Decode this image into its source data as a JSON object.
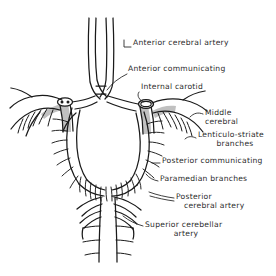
{
  "figure": {
    "style": "pen-and-ink anatomical line drawing",
    "ink_color": "#1a1a1a",
    "shade_color": "#6b6b6b",
    "background_color": "#ffffff",
    "text_color": "#2b2b2b"
  },
  "labels": [
    {
      "id": "anterior-cerebral-artery",
      "text": "Anterior cerebral artery",
      "lines": [
        "Anterior cerebral artery"
      ],
      "x": 133,
      "y": 44
    },
    {
      "id": "anterior-communicating",
      "text": "Anterior communicating",
      "lines": [
        "Anterior communicating"
      ],
      "x": 128,
      "y": 70
    },
    {
      "id": "internal-carotid",
      "text": "Internal carotid",
      "lines": [
        "Internal carotid"
      ],
      "x": 141,
      "y": 88
    },
    {
      "id": "middle-cerebral",
      "text": "Middle cerebral",
      "lines": [
        "Middle",
        "cerebral"
      ],
      "x": 205,
      "y": 114
    },
    {
      "id": "lenticulo-striate-branches",
      "text": "Lenticulo-striate branches",
      "lines": [
        "Lenticulo-striate",
        "branches"
      ],
      "x": 198,
      "y": 136
    },
    {
      "id": "posterior-communicating",
      "text": "Posterior communicating",
      "lines": [
        "Posterior communicating"
      ],
      "x": 162,
      "y": 161
    },
    {
      "id": "paramedian-branches",
      "text": "Paramedian branches",
      "lines": [
        "Paramedian branches"
      ],
      "x": 160,
      "y": 179
    },
    {
      "id": "posterior-cerebral-artery",
      "text": "Posterior cerebral artery",
      "lines": [
        "Posterior",
        "cerebral artery"
      ],
      "x": 176,
      "y": 196
    },
    {
      "id": "superior-cerebellar-artery",
      "text": "Superior cerebellar artery",
      "lines": [
        "Superior cerebellar",
        "artery"
      ],
      "x": 145,
      "y": 224
    }
  ],
  "structures": [
    {
      "id": "anterior-cerebral-arteries",
      "name": "Anterior cerebral arteries",
      "note": "paired vertical vessels ascending from top of circle"
    },
    {
      "id": "anterior-communicating-artery",
      "name": "Anterior communicating artery",
      "note": "short bridge joining the two anterior cerebrals"
    },
    {
      "id": "internal-carotid-left",
      "name": "Left internal carotid artery",
      "note": "cut stump, shaded, elliptical lumen"
    },
    {
      "id": "internal-carotid-right",
      "name": "Right internal carotid artery",
      "note": "cut stump, shaded, elliptical lumen"
    },
    {
      "id": "middle-cerebral-left",
      "name": "Left middle cerebral artery",
      "note": "curves laterally with lenticulostriate twigs"
    },
    {
      "id": "middle-cerebral-right",
      "name": "Right middle cerebral artery",
      "note": "curves laterally with lenticulostriate twigs"
    },
    {
      "id": "posterior-communicating-left",
      "name": "Left posterior communicating artery"
    },
    {
      "id": "posterior-communicating-right",
      "name": "Right posterior communicating artery"
    },
    {
      "id": "posterior-cerebral-left",
      "name": "Left posterior cerebral artery"
    },
    {
      "id": "posterior-cerebral-right",
      "name": "Right posterior cerebral artery"
    },
    {
      "id": "superior-cerebellar-left",
      "name": "Left superior cerebellar artery"
    },
    {
      "id": "superior-cerebellar-right",
      "name": "Right superior cerebellar artery"
    },
    {
      "id": "basilar-artery",
      "name": "Basilar artery",
      "note": "midline trunk descending with pontine branches"
    },
    {
      "id": "paramedian-perforators",
      "name": "Paramedian perforating branches",
      "note": "fine twigs around the interpeduncular fossa"
    }
  ]
}
